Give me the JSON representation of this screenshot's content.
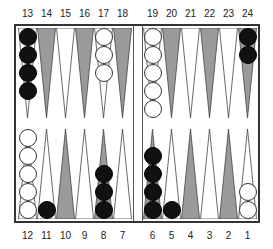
{
  "colors": {
    "dark_point": "#9a9a9a",
    "light_point": "#ffffff",
    "point_outline": "#444444",
    "black_checker": "#111111",
    "white_checker": "#ffffff",
    "board_border": "#333333"
  },
  "top_labels": [
    "13",
    "14",
    "15",
    "16",
    "17",
    "18",
    "19",
    "20",
    "21",
    "22",
    "23",
    "24"
  ],
  "bottom_labels": [
    "12",
    "11",
    "10",
    "9",
    "8",
    "7",
    "6",
    "5",
    "4",
    "3",
    "2",
    "1"
  ],
  "points": {
    "13": {
      "shade": "light",
      "checkers": {
        "color": "black",
        "count": 4
      }
    },
    "14": {
      "shade": "dark",
      "checkers": {
        "color": "none",
        "count": 0
      }
    },
    "15": {
      "shade": "light",
      "checkers": {
        "color": "none",
        "count": 0
      }
    },
    "16": {
      "shade": "dark",
      "checkers": {
        "color": "none",
        "count": 0
      }
    },
    "17": {
      "shade": "light",
      "checkers": {
        "color": "white",
        "count": 3
      }
    },
    "18": {
      "shade": "dark",
      "checkers": {
        "color": "none",
        "count": 0
      }
    },
    "19": {
      "shade": "light",
      "checkers": {
        "color": "white",
        "count": 5
      }
    },
    "20": {
      "shade": "dark",
      "checkers": {
        "color": "none",
        "count": 0
      }
    },
    "21": {
      "shade": "light",
      "checkers": {
        "color": "none",
        "count": 0
      }
    },
    "22": {
      "shade": "dark",
      "checkers": {
        "color": "none",
        "count": 0
      }
    },
    "23": {
      "shade": "light",
      "checkers": {
        "color": "none",
        "count": 0
      }
    },
    "24": {
      "shade": "dark",
      "checkers": {
        "color": "black",
        "count": 2
      }
    },
    "12": {
      "shade": "light",
      "checkers": {
        "color": "white",
        "count": 5
      }
    },
    "11": {
      "shade": "light",
      "checkers": {
        "color": "black",
        "count": 1
      }
    },
    "10": {
      "shade": "dark",
      "checkers": {
        "color": "none",
        "count": 0
      }
    },
    "9": {
      "shade": "light",
      "checkers": {
        "color": "none",
        "count": 0
      }
    },
    "8": {
      "shade": "dark",
      "checkers": {
        "color": "black",
        "count": 3
      }
    },
    "7": {
      "shade": "light",
      "checkers": {
        "color": "none",
        "count": 0
      }
    },
    "6": {
      "shade": "dark",
      "checkers": {
        "color": "black",
        "count": 4
      }
    },
    "5": {
      "shade": "light",
      "checkers": {
        "color": "black",
        "count": 1
      }
    },
    "4": {
      "shade": "dark",
      "checkers": {
        "color": "none",
        "count": 0
      }
    },
    "3": {
      "shade": "light",
      "checkers": {
        "color": "none",
        "count": 0
      }
    },
    "2": {
      "shade": "dark",
      "checkers": {
        "color": "none",
        "count": 0
      }
    },
    "1": {
      "shade": "light",
      "checkers": {
        "color": "white",
        "count": 2
      }
    }
  }
}
